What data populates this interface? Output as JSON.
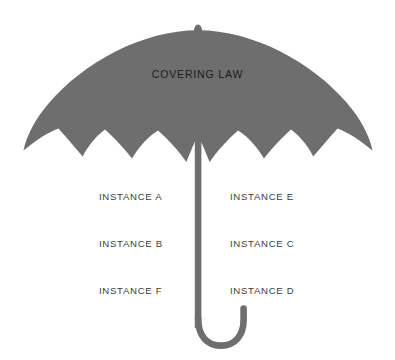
{
  "diagram": {
    "name": "covering-law-umbrella",
    "background_color": "#ffffff",
    "umbrella_color": "#6e6e6e",
    "title_color": "#1c1c1c",
    "label_color": "#3b3b3b",
    "canopy": {
      "title": "COVERING LAW"
    },
    "instances": {
      "left_column": [
        {
          "label": "INSTANCE A"
        },
        {
          "label": "INSTANCE B"
        },
        {
          "label": "INSTANCE F"
        }
      ],
      "right_column": [
        {
          "label": "INSTANCE E"
        },
        {
          "label": "INSTANCE C"
        },
        {
          "label": "INSTANCE D"
        }
      ]
    },
    "parts": [
      {
        "name": "canopy-icon"
      },
      {
        "name": "finial-icon"
      },
      {
        "name": "shaft-icon"
      },
      {
        "name": "handle-hook-icon"
      }
    ]
  }
}
